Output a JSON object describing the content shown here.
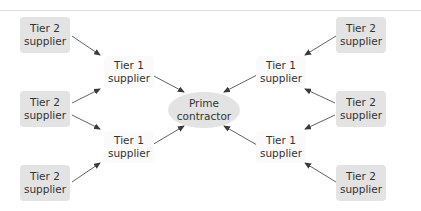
{
  "diagram": {
    "type": "supply-chain hierarchy",
    "colors": {
      "box_fill": "#e3e3e3",
      "text": "#333333",
      "arrow": "#3a3a3a",
      "rule": "#dcdcdc"
    },
    "prime": {
      "line1": "Prime",
      "line2": "contractor"
    },
    "tier1": [
      {
        "id": "t1-top-left",
        "line1": "Tier 1",
        "line2": "supplier"
      },
      {
        "id": "t1-bottom-left",
        "line1": "Tier 1",
        "line2": "supplier"
      },
      {
        "id": "t1-top-right",
        "line1": "Tier 1",
        "line2": "supplier"
      },
      {
        "id": "t1-bottom-right",
        "line1": "Tier 1",
        "line2": "supplier"
      }
    ],
    "tier2": [
      {
        "id": "t2-left-top",
        "line1": "Tier 2",
        "line2": "supplier"
      },
      {
        "id": "t2-left-middle",
        "line1": "Tier 2",
        "line2": "supplier"
      },
      {
        "id": "t2-left-bottom",
        "line1": "Tier 2",
        "line2": "supplier"
      },
      {
        "id": "t2-right-top",
        "line1": "Tier 2",
        "line2": "supplier"
      },
      {
        "id": "t2-right-middle",
        "line1": "Tier 2",
        "line2": "supplier"
      },
      {
        "id": "t2-right-bottom",
        "line1": "Tier 2",
        "line2": "supplier"
      }
    ],
    "edges": [
      {
        "from": "t2-left-top",
        "to": "t1-top-left"
      },
      {
        "from": "t2-left-middle",
        "to": "t1-top-left"
      },
      {
        "from": "t2-left-middle",
        "to": "t1-bottom-left"
      },
      {
        "from": "t2-left-bottom",
        "to": "t1-bottom-left"
      },
      {
        "from": "t2-right-top",
        "to": "t1-top-right"
      },
      {
        "from": "t2-right-middle",
        "to": "t1-top-right"
      },
      {
        "from": "t2-right-middle",
        "to": "t1-bottom-right"
      },
      {
        "from": "t2-right-bottom",
        "to": "t1-bottom-right"
      },
      {
        "from": "t1-top-left",
        "to": "prime"
      },
      {
        "from": "t1-bottom-left",
        "to": "prime"
      },
      {
        "from": "t1-top-right",
        "to": "prime"
      },
      {
        "from": "t1-bottom-right",
        "to": "prime"
      }
    ]
  }
}
